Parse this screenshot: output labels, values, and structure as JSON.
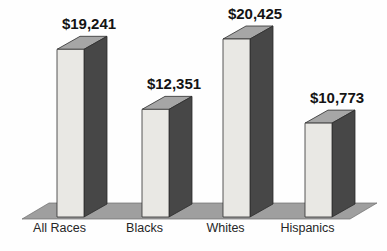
{
  "chart_data": {
    "type": "bar",
    "style": "3d-oblique-grayscale-scan",
    "title": "",
    "xlabel": "",
    "ylabel": "",
    "categories": [
      "All Races",
      "Blacks",
      "Whites",
      "Hispanics"
    ],
    "values": [
      19241,
      12351,
      20425,
      10773
    ],
    "value_labels": [
      "$19,241",
      "$12,351",
      "$20,425",
      "$10,773"
    ],
    "ylim": [
      0,
      20425
    ],
    "grid": false,
    "legend": false,
    "colors": {
      "bar_front": "#e9e8e4",
      "bar_top": "#a6a6a6",
      "bar_side": "#474747",
      "floor": "#9f9f9f",
      "outline": "#2f2f2f",
      "value_text": "#141414",
      "category_text": "#262626",
      "background": "#fefefe"
    }
  }
}
